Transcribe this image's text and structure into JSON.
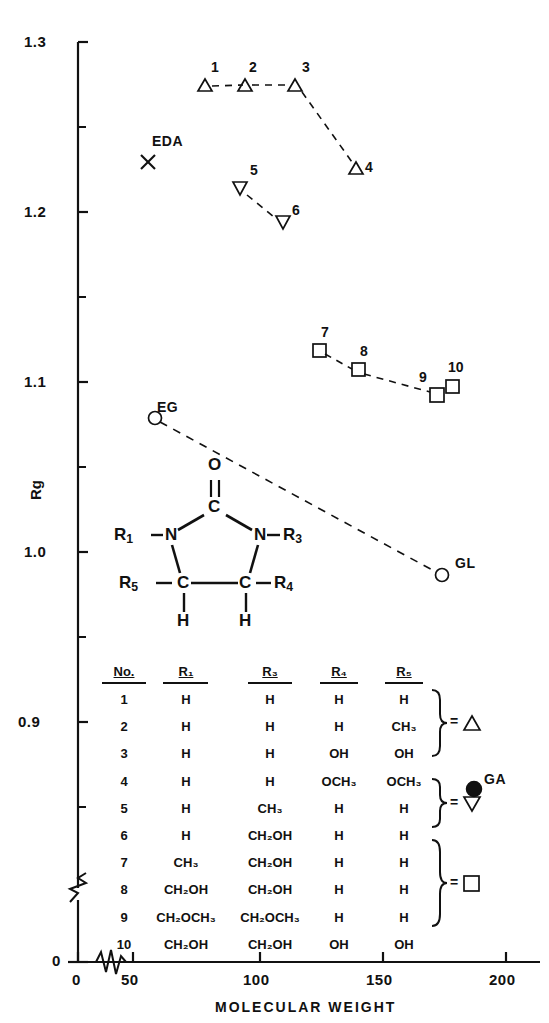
{
  "chart_data": {
    "type": "scatter",
    "title": "",
    "xlabel": "MOLECULAR WEIGHT",
    "ylabel": "Rg",
    "xlim": [
      0,
      215
    ],
    "ylim": [
      0.855,
      1.3
    ],
    "xticks": [
      0,
      50,
      100,
      150,
      200
    ],
    "yticks": [
      "0",
      "0.9",
      "1.0",
      "1.1",
      "1.2",
      "1.3"
    ],
    "axis_break_x": true,
    "axis_break_y": true,
    "grid": false,
    "legend_position": "inside-right",
    "series": [
      {
        "name": "triangle-up-group",
        "marker": "triangle-up",
        "connected": true,
        "linestyle": "dashed",
        "points": [
          {
            "label": "1",
            "x": 86,
            "y": 1.278
          },
          {
            "label": "2",
            "x": 100,
            "y": 1.278
          },
          {
            "label": "3",
            "x": 118,
            "y": 1.279
          },
          {
            "label": "4",
            "x": 141,
            "y": 1.232
          }
        ]
      },
      {
        "name": "triangle-down-group",
        "marker": "triangle-down",
        "connected": true,
        "linestyle": "dashed",
        "points": [
          {
            "label": "5",
            "x": 100,
            "y": 1.219
          },
          {
            "label": "6",
            "x": 116,
            "y": 1.199
          }
        ]
      },
      {
        "name": "square-group",
        "marker": "square",
        "connected": true,
        "linestyle": "dashed",
        "points": [
          {
            "label": "7",
            "x": 127,
            "y": 1.127
          },
          {
            "label": "8",
            "x": 146,
            "y": 1.114
          },
          {
            "label": "9",
            "x": 170,
            "y": 1.099
          },
          {
            "label": "10",
            "x": 176,
            "y": 1.102
          }
        ]
      },
      {
        "name": "glycol-group",
        "marker": "circle-open",
        "connected": true,
        "linestyle": "dashed",
        "points": [
          {
            "label": "EG",
            "x": 62,
            "y": 1.088
          },
          {
            "label": "GL",
            "x": 173,
            "y": 1.001
          }
        ]
      },
      {
        "name": "EDA",
        "marker": "cross",
        "connected": false,
        "points": [
          {
            "label": "EDA",
            "x": 60,
            "y": 1.23
          }
        ]
      },
      {
        "name": "GA",
        "marker": "circle-filled",
        "connected": false,
        "points": [
          {
            "label": "GA",
            "x": 192,
            "y": 0.905
          }
        ]
      }
    ]
  },
  "structure": {
    "caption": "imidazolidinone-ring",
    "atoms": {
      "oxygen": "O",
      "carbonyl_carbon": "C",
      "nitrogen_left": "N",
      "nitrogen_right": "N",
      "carbon_left": "C",
      "carbon_right": "C",
      "hydrogen_left": "H",
      "hydrogen_right": "H"
    },
    "substituent_labels": {
      "r1": "R",
      "r1_sub": "1",
      "r3": "R",
      "r3_sub": "3",
      "r4": "R",
      "r4_sub": "4",
      "r5": "R",
      "r5_sub": "5"
    }
  },
  "table": {
    "headers": [
      "No.",
      "R₁",
      "R₃",
      "R₄",
      "R₅"
    ],
    "headers_plain": [
      "No.",
      "R1",
      "R3",
      "R4",
      "R5"
    ],
    "rows": [
      {
        "no": "1",
        "r1": "H",
        "r3": "H",
        "r4": "H",
        "r5": "H"
      },
      {
        "no": "2",
        "r1": "H",
        "r3": "H",
        "r4": "H",
        "r5": "CH₃"
      },
      {
        "no": "3",
        "r1": "H",
        "r3": "H",
        "r4": "OH",
        "r5": "OH"
      },
      {
        "no": "4",
        "r1": "H",
        "r3": "H",
        "r4": "OCH₃",
        "r5": "OCH₃"
      },
      {
        "no": "5",
        "r1": "H",
        "r3": "CH₃",
        "r4": "H",
        "r5": "H"
      },
      {
        "no": "6",
        "r1": "H",
        "r3": "CH₂OH",
        "r4": "H",
        "r5": "H"
      },
      {
        "no": "7",
        "r1": "CH₃",
        "r3": "CH₂OH",
        "r4": "H",
        "r5": "H"
      },
      {
        "no": "8",
        "r1": "CH₂OH",
        "r3": "CH₂OH",
        "r4": "H",
        "r5": "H"
      },
      {
        "no": "9",
        "r1": "CH₂OCH₃",
        "r3": "CH₂OCH₃",
        "r4": "H",
        "r5": "H"
      },
      {
        "no": "10",
        "r1": "CH₂OH",
        "r3": "CH₂OH",
        "r4": "OH",
        "r5": "OH"
      }
    ],
    "legend_groups": [
      {
        "rows": "1-4",
        "equals": "=",
        "marker": "triangle-up"
      },
      {
        "rows": "5-6",
        "equals": "=",
        "marker": "triangle-down"
      },
      {
        "rows": "7-10",
        "equals": "=",
        "marker": "square"
      }
    ]
  },
  "colors": {
    "ink": "#111111",
    "background": "#ffffff"
  }
}
